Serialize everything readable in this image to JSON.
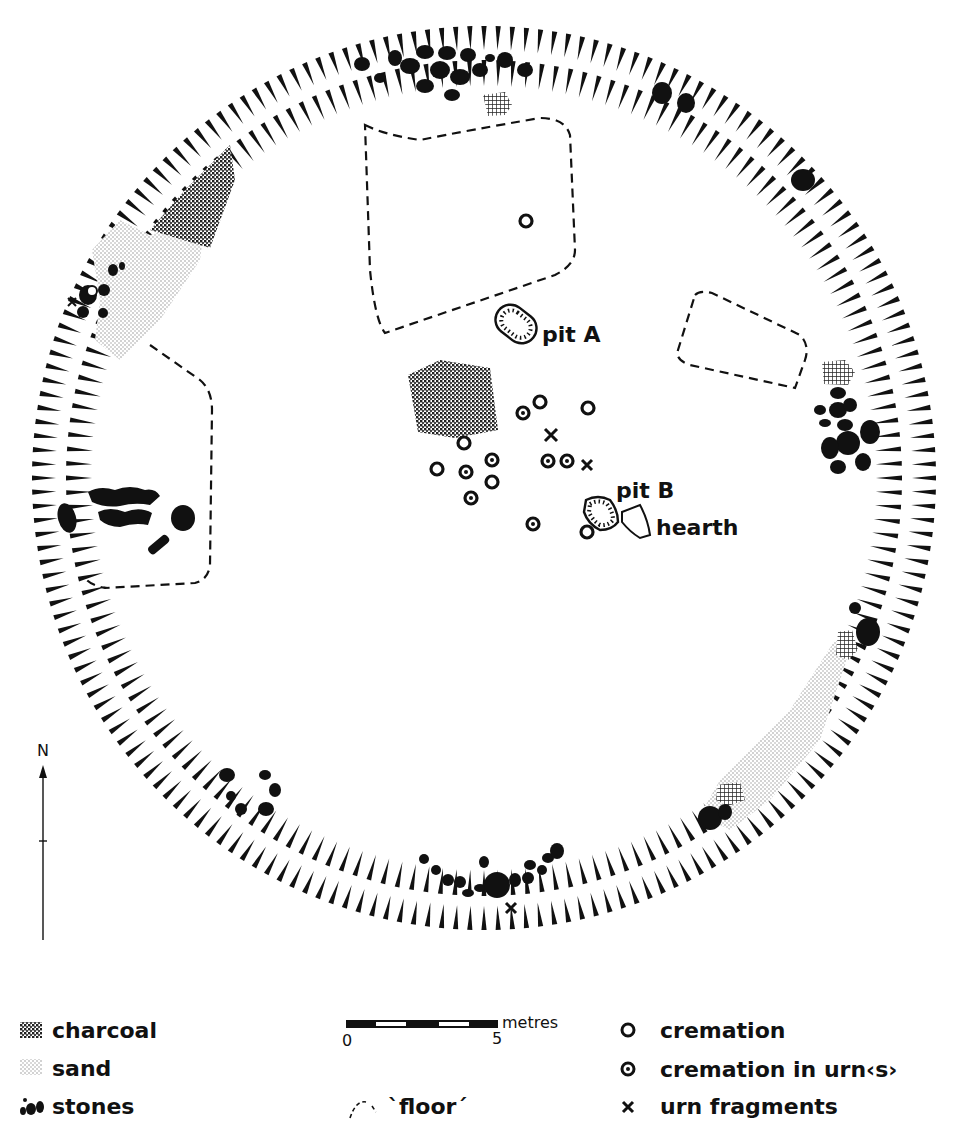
{
  "figure": {
    "type": "archaeological site plan"
  },
  "labels": {
    "pit_a": "pit A",
    "pit_b": "pit B",
    "hearth": "hearth"
  },
  "north_arrow": {
    "label": "N"
  },
  "scale_bar": {
    "unit": "metres",
    "start": "0",
    "end": "5"
  },
  "legend": {
    "items": [
      {
        "symbol": "charcoal-pattern",
        "label": "charcoal"
      },
      {
        "symbol": "sand-pattern",
        "label": "sand"
      },
      {
        "symbol": "stones-symbol",
        "label": "stones"
      },
      {
        "symbol": "floor-dashed-line",
        "label": "`floor´"
      },
      {
        "symbol": "circle-open",
        "label": "cremation"
      },
      {
        "symbol": "circle-dot",
        "label": "cremation in urn‹s›"
      },
      {
        "symbol": "cross",
        "label": "urn fragments"
      }
    ]
  },
  "features": {
    "cremations": 12,
    "cremations_in_urns": 9,
    "urn_fragments": 4
  },
  "colors": {
    "ink": "#111111",
    "background": "#ffffff"
  }
}
